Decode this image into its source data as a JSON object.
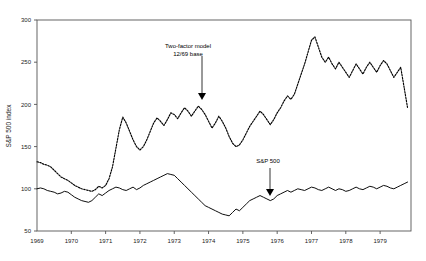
{
  "chart_data": {
    "type": "line",
    "title": "",
    "xlabel": "",
    "ylabel": "S&P 500 index",
    "xlim": [
      1969.0,
      1979.9
    ],
    "ylim": [
      50,
      300
    ],
    "ytick_values": [
      50,
      100,
      150,
      200,
      250,
      300
    ],
    "ytick_labels": [
      "50",
      "100",
      "150",
      "200",
      "250",
      "300"
    ],
    "xtick_values": [
      1969,
      1970,
      1971,
      1972,
      1973,
      1974,
      1975,
      1976,
      1977,
      1978,
      1979
    ],
    "xtick_labels": [
      "1969",
      "1970",
      "1971",
      "1972",
      "1973",
      "1974",
      "1975",
      "1976",
      "1977",
      "1978",
      "1979"
    ],
    "grid": false,
    "legend": "none",
    "frame": true,
    "series": [
      {
        "name": "Two-factor model 12/69 base",
        "style": "dashed",
        "color": "#000000",
        "x": [
          1969.0,
          1969.1,
          1969.2,
          1969.3,
          1969.4,
          1969.5,
          1969.6,
          1969.7,
          1969.8,
          1969.9,
          1970.0,
          1970.1,
          1970.2,
          1970.3,
          1970.4,
          1970.5,
          1970.6,
          1970.7,
          1970.8,
          1970.9,
          1971.0,
          1971.1,
          1971.2,
          1971.3,
          1971.4,
          1971.5,
          1971.6,
          1971.7,
          1971.8,
          1971.9,
          1972.0,
          1972.1,
          1972.2,
          1972.3,
          1972.4,
          1972.5,
          1972.6,
          1972.7,
          1972.8,
          1972.9,
          1973.0,
          1973.1,
          1973.2,
          1973.3,
          1973.4,
          1973.5,
          1973.6,
          1973.7,
          1973.8,
          1973.9,
          1974.0,
          1974.1,
          1974.2,
          1974.3,
          1974.4,
          1974.5,
          1974.6,
          1974.7,
          1974.8,
          1974.9,
          1975.0,
          1975.1,
          1975.2,
          1975.3,
          1975.4,
          1975.5,
          1975.6,
          1975.7,
          1975.8,
          1975.9,
          1976.0,
          1976.1,
          1976.2,
          1976.3,
          1976.4,
          1976.5,
          1976.6,
          1976.7,
          1976.8,
          1976.9,
          1977.0,
          1977.1,
          1977.2,
          1977.3,
          1977.4,
          1977.5,
          1977.6,
          1977.7,
          1977.8,
          1977.9,
          1978.0,
          1978.1,
          1978.2,
          1978.3,
          1978.4,
          1978.5,
          1978.6,
          1978.7,
          1978.8,
          1978.9,
          1979.0,
          1979.1,
          1979.2,
          1979.3,
          1979.4,
          1979.5,
          1979.6,
          1979.7,
          1979.8
        ],
        "y": [
          132,
          131,
          129,
          128,
          126,
          122,
          118,
          114,
          112,
          110,
          107,
          104,
          102,
          100,
          99,
          98,
          97,
          99,
          103,
          101,
          104,
          112,
          126,
          148,
          170,
          185,
          178,
          168,
          158,
          150,
          146,
          150,
          158,
          168,
          178,
          184,
          180,
          175,
          182,
          190,
          188,
          183,
          190,
          196,
          192,
          186,
          192,
          198,
          194,
          188,
          180,
          172,
          178,
          186,
          180,
          172,
          162,
          154,
          150,
          152,
          158,
          166,
          174,
          180,
          186,
          192,
          188,
          182,
          176,
          182,
          190,
          196,
          204,
          210,
          206,
          212,
          224,
          236,
          248,
          262,
          276,
          280,
          268,
          256,
          250,
          256,
          248,
          242,
          250,
          244,
          238,
          232,
          240,
          248,
          242,
          236,
          244,
          250,
          244,
          238,
          246,
          252,
          248,
          240,
          232,
          238,
          244,
          220,
          196
        ]
      },
      {
        "name": "S&P 500",
        "style": "solid",
        "color": "#000000",
        "x": [
          1969.0,
          1969.1,
          1969.2,
          1969.3,
          1969.4,
          1969.5,
          1969.6,
          1969.7,
          1969.8,
          1969.9,
          1970.0,
          1970.1,
          1970.2,
          1970.3,
          1970.4,
          1970.5,
          1970.6,
          1970.7,
          1970.8,
          1970.9,
          1971.0,
          1971.1,
          1971.2,
          1971.3,
          1971.4,
          1971.5,
          1971.6,
          1971.7,
          1971.8,
          1971.9,
          1972.0,
          1972.1,
          1972.2,
          1972.3,
          1972.4,
          1972.5,
          1972.6,
          1972.7,
          1972.8,
          1972.9,
          1973.0,
          1973.1,
          1973.2,
          1973.3,
          1973.4,
          1973.5,
          1973.6,
          1973.7,
          1973.8,
          1973.9,
          1974.0,
          1974.1,
          1974.2,
          1974.3,
          1974.4,
          1974.5,
          1974.6,
          1974.7,
          1974.8,
          1974.9,
          1975.0,
          1975.1,
          1975.2,
          1975.3,
          1975.4,
          1975.5,
          1975.6,
          1975.7,
          1975.8,
          1975.9,
          1976.0,
          1976.1,
          1976.2,
          1976.3,
          1976.4,
          1976.5,
          1976.6,
          1976.7,
          1976.8,
          1976.9,
          1977.0,
          1977.1,
          1977.2,
          1977.3,
          1977.4,
          1977.5,
          1977.6,
          1977.7,
          1977.8,
          1977.9,
          1978.0,
          1978.1,
          1978.2,
          1978.3,
          1978.4,
          1978.5,
          1978.6,
          1978.7,
          1978.8,
          1978.9,
          1979.0,
          1979.1,
          1979.2,
          1979.3,
          1979.4,
          1979.5,
          1979.6,
          1979.7,
          1979.8
        ],
        "y": [
          100,
          101,
          100,
          98,
          97,
          96,
          94,
          95,
          97,
          96,
          93,
          90,
          88,
          86,
          85,
          84,
          86,
          90,
          94,
          92,
          95,
          98,
          100,
          102,
          101,
          99,
          98,
          100,
          102,
          99,
          101,
          104,
          106,
          108,
          110,
          112,
          114,
          116,
          118,
          117,
          116,
          112,
          108,
          104,
          100,
          96,
          92,
          88,
          84,
          80,
          78,
          76,
          74,
          72,
          70,
          69,
          68,
          72,
          76,
          74,
          78,
          82,
          86,
          88,
          90,
          92,
          90,
          88,
          86,
          88,
          92,
          94,
          96,
          98,
          96,
          98,
          100,
          99,
          98,
          100,
          102,
          101,
          99,
          98,
          100,
          102,
          100,
          98,
          100,
          99,
          97,
          98,
          100,
          102,
          100,
          99,
          101,
          103,
          102,
          100,
          102,
          104,
          103,
          101,
          100,
          102,
          104,
          106,
          108
        ]
      }
    ],
    "annotations": [
      {
        "name": "two-factor-annotation",
        "line1": "Two-factor model",
        "line2": "12/69  base",
        "text_x": 188,
        "text_y": 48,
        "arrow_x": 202,
        "arrow_y0": 56,
        "arrow_y1": 100
      },
      {
        "name": "sp500-annotation",
        "line1": "S&P 500",
        "line2": "",
        "text_x": 268,
        "text_y": 163,
        "arrow_x": 270,
        "arrow_y0": 168,
        "arrow_y1": 196
      }
    ]
  }
}
